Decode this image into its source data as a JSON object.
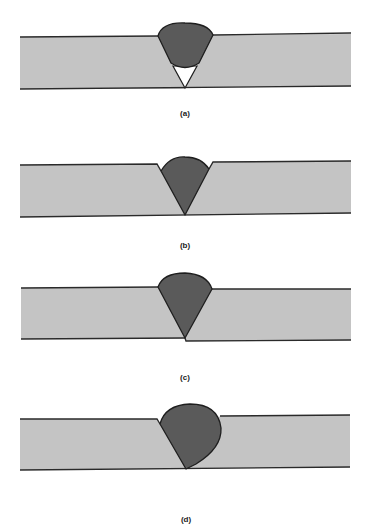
{
  "figure": {
    "panels": [
      {
        "id": "a",
        "caption": "(a)",
        "description": "Incomplete root penetration – weld bead does not reach root, leaving unfused triangular void at bottom of V-groove"
      },
      {
        "id": "b",
        "caption": "(b)",
        "description": "Undercut – weld face sits below plate surface with notches at both toes"
      },
      {
        "id": "c",
        "caption": "(c)",
        "description": "Misalignment (high-low) – plates offset vertically at the root"
      },
      {
        "id": "d",
        "caption": "(d)",
        "description": "Excess reinforcement / overlap – oversized bulbous weld bead overlapping right plate"
      }
    ],
    "colors": {
      "plate": "#c4c4c4",
      "weld": "#5a5a5a",
      "outline": "#1e1e1e",
      "void": "#ffffff",
      "background": "#ffffff"
    }
  }
}
